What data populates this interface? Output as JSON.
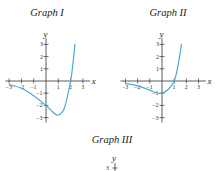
{
  "figure": {
    "graphs": [
      {
        "title": "Graph I"
      },
      {
        "title": "Graph II"
      },
      {
        "title": "Graph III"
      }
    ],
    "axis_labels": {
      "x": "x",
      "y": "y"
    },
    "curve_color": "#4aa8d8"
  },
  "chart_data": [
    {
      "type": "line",
      "title": "Graph I",
      "xlabel": "x",
      "ylabel": "y",
      "xlim": [
        -3,
        3
      ],
      "ylim": [
        -3,
        3
      ],
      "x_ticks": [
        -3,
        -2,
        -1,
        1,
        2,
        3
      ],
      "y_ticks": [
        -3,
        -2,
        -1,
        1,
        2,
        3
      ],
      "grid": false,
      "series": [
        {
          "name": "curve",
          "x": [
            -3,
            -2,
            -1,
            0,
            0.5,
            1,
            1.5,
            2,
            2.2,
            2.35
          ],
          "y": [
            -0.3,
            -0.6,
            -1.2,
            -2.0,
            -2.5,
            -2.8,
            -2.2,
            0.0,
            1.5,
            3.0
          ]
        }
      ]
    },
    {
      "type": "line",
      "title": "Graph II",
      "xlabel": "x",
      "ylabel": "y",
      "xlim": [
        -3,
        3
      ],
      "ylim": [
        -3,
        3
      ],
      "x_ticks": [
        -3,
        -2,
        -1,
        1,
        2,
        3
      ],
      "y_ticks": [
        -3,
        -2,
        -1,
        1,
        2,
        3
      ],
      "grid": false,
      "series": [
        {
          "name": "curve",
          "x": [
            -3,
            -2,
            -1,
            -0.5,
            0,
            0.5,
            1,
            1.3,
            1.6
          ],
          "y": [
            -0.2,
            -0.4,
            -0.75,
            -0.95,
            -1.0,
            -0.7,
            0.0,
            1.2,
            3.0
          ]
        }
      ]
    },
    {
      "type": "line",
      "title": "Graph III",
      "xlabel": "",
      "ylabel": "y",
      "y_ticks": [
        3
      ],
      "series": []
    }
  ]
}
